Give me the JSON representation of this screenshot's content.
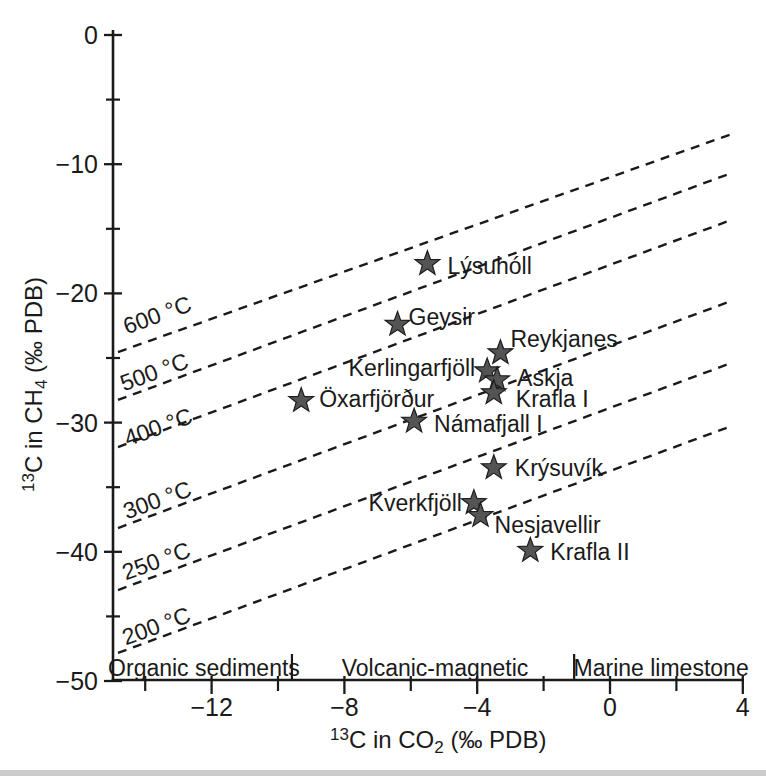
{
  "figure": {
    "width": 766,
    "height": 776,
    "background": "#ffffff",
    "ink_color": "#1a1a1a",
    "scan_edge_color": "#cccccc"
  },
  "chart_data": {
    "type": "scatter",
    "title": "",
    "xlabel_parts": [
      {
        "t": "13",
        "pos": "sup"
      },
      {
        "t": "C in CO",
        "pos": "n"
      },
      {
        "t": "2",
        "pos": "sub"
      },
      {
        "t": " (‰ PDB)",
        "pos": "n"
      }
    ],
    "ylabel_parts": [
      {
        "t": "13",
        "pos": "sup"
      },
      {
        "t": "C in CH",
        "pos": "n"
      },
      {
        "t": "4",
        "pos": "sub"
      },
      {
        "t": " (‰ PDB)",
        "pos": "n"
      }
    ],
    "xlim": [
      -14.97,
      4.01
    ],
    "ylim": [
      -50,
      0
    ],
    "x_major_ticks": [
      -12,
      -8,
      -4,
      0,
      4
    ],
    "x_minor_ticks": [
      -14,
      -10,
      -6,
      -2,
      2
    ],
    "y_major_ticks": [
      0,
      -10,
      -20,
      -30,
      -40,
      -50
    ],
    "y_minor_ticks": [
      -5,
      -15,
      -25,
      -35,
      -45
    ],
    "grid": false,
    "marker": "star",
    "marker_color": "#545454",
    "marker_edge_color": "#1c1c1c",
    "points": [
      {
        "name": "Lýsuhóll",
        "x": -5.5,
        "y": -17.7,
        "anchor": "start",
        "dx": 20,
        "dy": 2
      },
      {
        "name": "Geysir",
        "x": -6.4,
        "y": -22.4,
        "anchor": "start",
        "dx": 11,
        "dy": -7
      },
      {
        "name": "Reykjanes",
        "x": -3.3,
        "y": -24.6,
        "anchor": "start",
        "dx": 10,
        "dy": -14
      },
      {
        "name": "Kerlingarfjöll",
        "x": -3.7,
        "y": -26.0,
        "anchor": "end",
        "dx": -12,
        "dy": -3
      },
      {
        "name": "Askja",
        "x": -3.4,
        "y": -26.7,
        "anchor": "start",
        "dx": 20,
        "dy": -2
      },
      {
        "name": "Krafla I",
        "x": -3.5,
        "y": -27.7,
        "anchor": "start",
        "dx": 22,
        "dy": 6
      },
      {
        "name": "Öxarfjörður",
        "x": -9.3,
        "y": -28.3,
        "anchor": "start",
        "dx": 18,
        "dy": -2
      },
      {
        "name": "Námafjall I",
        "x": -5.9,
        "y": -29.9,
        "anchor": "start",
        "dx": 20,
        "dy": 3
      },
      {
        "name": "Krýsuvík",
        "x": -3.5,
        "y": -33.5,
        "anchor": "start",
        "dx": 21,
        "dy": 0
      },
      {
        "name": "Kverkfjöll",
        "x": -4.1,
        "y": -36.2,
        "anchor": "end",
        "dx": -12,
        "dy": 0
      },
      {
        "name": "Nesjavellir",
        "x": -3.9,
        "y": -37.2,
        "anchor": "start",
        "dx": 14,
        "dy": 9
      },
      {
        "name": "Krafla II",
        "x": -2.4,
        "y": -39.9,
        "anchor": "start",
        "dx": 20,
        "dy": 1
      }
    ],
    "isotherms": [
      {
        "label": "600 °C",
        "delta_permil": 11.0,
        "x1": -14.82,
        "y1": -24.54,
        "x2": 3.64,
        "y2": -7.69,
        "lx": -13.64,
        "ly": -21.67
      },
      {
        "label": "500 °C",
        "delta_permil": 14.2,
        "x1": -14.82,
        "y1": -28.25,
        "x2": 3.64,
        "y2": -10.7,
        "lx": -13.73,
        "ly": -26.08
      },
      {
        "label": "400 °C",
        "delta_permil": 17.8,
        "x1": -14.82,
        "y1": -31.89,
        "x2": 3.64,
        "y2": -14.33,
        "lx": -13.61,
        "ly": -30.34
      },
      {
        "label": "300 °C",
        "delta_permil": 24.1,
        "x1": -14.82,
        "y1": -38.16,
        "x2": 3.64,
        "y2": -20.6,
        "lx": -13.64,
        "ly": -35.99
      },
      {
        "label": "250 °C",
        "delta_permil": 28.9,
        "x1": -14.82,
        "y1": -42.96,
        "x2": 3.64,
        "y2": -25.4,
        "lx": -13.67,
        "ly": -40.71
      },
      {
        "label": "200 °C",
        "delta_permil": 33.7,
        "x1": -14.82,
        "y1": -47.83,
        "x2": 3.64,
        "y2": -30.28,
        "lx": -13.67,
        "ly": -45.74
      }
    ],
    "regions": {
      "labels": [
        {
          "label": "Organic sediments",
          "cx": -12.23
        },
        {
          "label": "Volcanic-magnetic",
          "cx": -5.27
        },
        {
          "label": "Marine limestone",
          "cx": 1.54
        }
      ],
      "boundaries": [
        -9.58,
        -1.08
      ]
    },
    "legend": null
  }
}
